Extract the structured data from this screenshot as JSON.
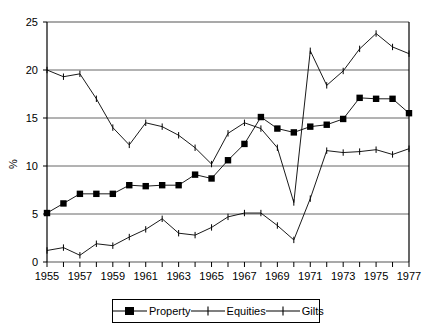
{
  "chart_data": {
    "type": "line",
    "title": "",
    "xlabel": "",
    "ylabel": "%",
    "xlim": [
      1955,
      1977
    ],
    "ylim": [
      0,
      25
    ],
    "yticks": [
      0,
      5,
      10,
      15,
      20,
      25
    ],
    "xticks": [
      1955,
      1957,
      1959,
      1961,
      1963,
      1965,
      1967,
      1969,
      1971,
      1973,
      1975,
      1977
    ],
    "x": [
      1955,
      1956,
      1957,
      1958,
      1959,
      1960,
      1961,
      1962,
      1963,
      1964,
      1965,
      1966,
      1967,
      1968,
      1969,
      1970,
      1971,
      1972,
      1973,
      1974,
      1975,
      1976,
      1977
    ],
    "grid": "horizontal",
    "legend_position": "bottom-center",
    "series": [
      {
        "name": "Property",
        "marker": "filled-square",
        "values": [
          5.1,
          6.1,
          7.1,
          7.1,
          7.1,
          8.0,
          7.9,
          8.0,
          8.0,
          9.1,
          8.7,
          10.6,
          12.3,
          15.1,
          13.9,
          13.5,
          14.1,
          14.3,
          14.9,
          17.1,
          17.0,
          17.0,
          15.5
        ]
      },
      {
        "name": "Equities",
        "marker": "plus",
        "values": [
          1.2,
          1.5,
          0.7,
          1.9,
          1.7,
          2.6,
          3.4,
          4.5,
          3.0,
          2.8,
          3.6,
          4.7,
          5.1,
          5.1,
          3.8,
          2.3,
          6.6,
          11.6,
          11.4,
          11.5,
          11.7,
          11.2,
          11.8
        ]
      },
      {
        "name": "Gilts",
        "marker": "plus",
        "values": [
          20.0,
          19.3,
          19.6,
          17.0,
          14.0,
          12.2,
          14.5,
          14.1,
          13.2,
          11.9,
          10.2,
          13.4,
          14.5,
          13.9,
          11.9,
          6.2,
          22.0,
          18.4,
          19.9,
          22.2,
          23.8,
          22.4,
          21.7
        ]
      }
    ]
  },
  "legend": {
    "items": [
      {
        "label": "Property",
        "marker": "filled-square"
      },
      {
        "label": "Equities",
        "marker": "plus"
      },
      {
        "label": "Gilts",
        "marker": "plus"
      }
    ]
  }
}
